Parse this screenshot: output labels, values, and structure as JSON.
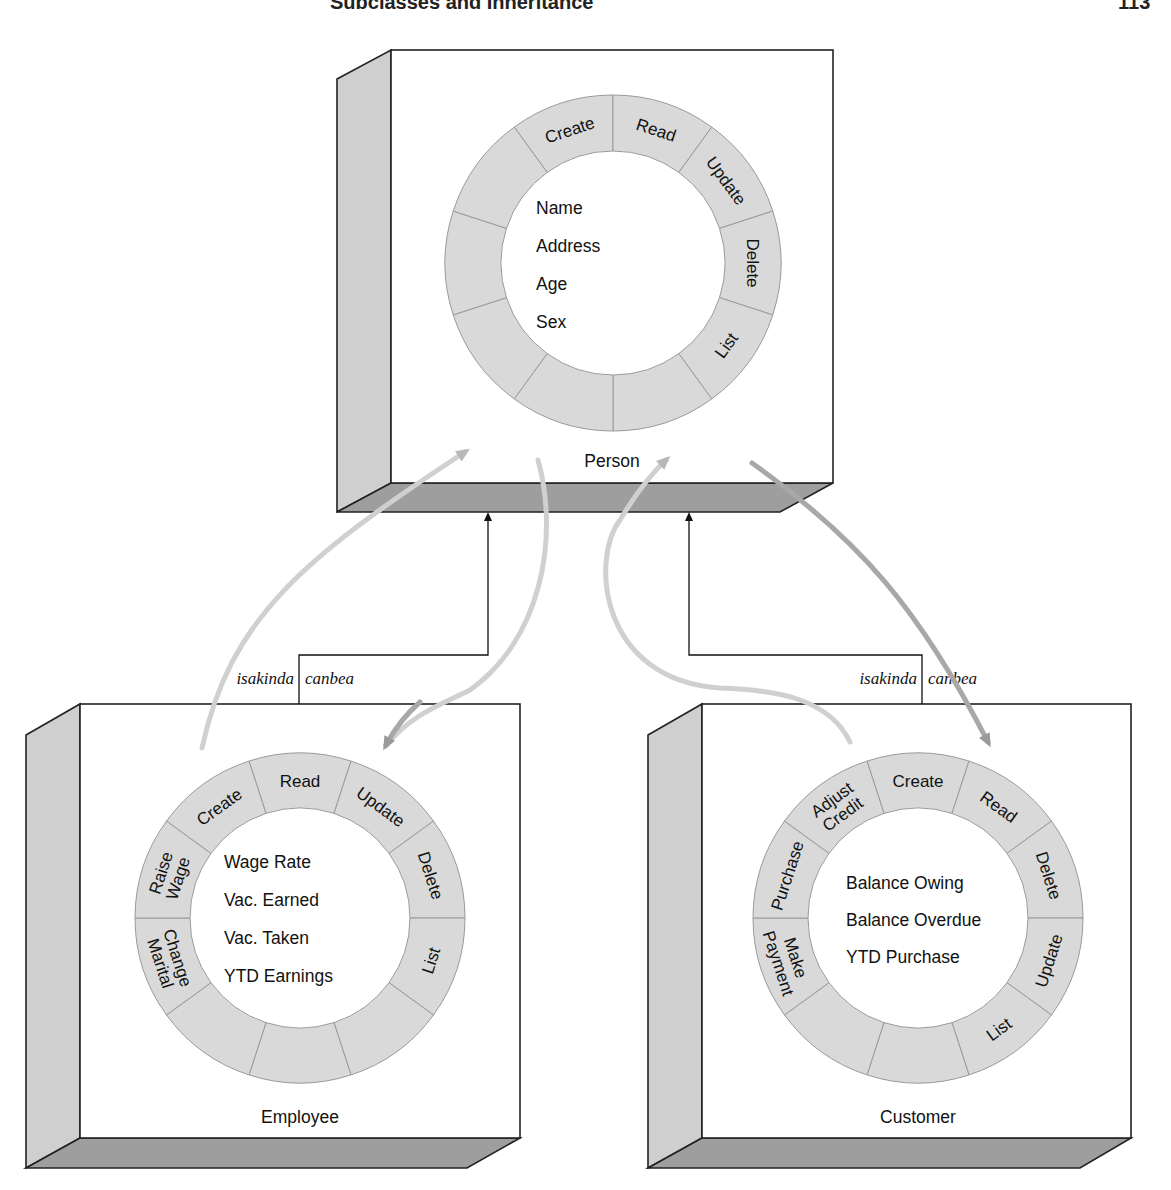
{
  "page_header": {
    "left_fragment": "Subclasses and Inheritance",
    "right_fragment": "113"
  },
  "colors": {
    "ring_fill": "#d9d9d9",
    "ring_stroke": "#9a9a9a",
    "box_side": "#cfcfcf",
    "box_bottom": "#9e9e9e",
    "arrow_light": "#d0d0d0",
    "arrow_dark": "#a8a8a8"
  },
  "classes": {
    "person": {
      "name": "Person",
      "attributes": [
        "Name",
        "Address",
        "Age",
        "Sex"
      ],
      "operations": [
        "Create",
        "Read",
        "Update",
        "Delete",
        "List",
        "",
        "",
        "",
        "",
        ""
      ]
    },
    "employee": {
      "name": "Employee",
      "attributes": [
        "Wage Rate",
        "Vac. Earned",
        "Vac. Taken",
        "YTD Earnings"
      ],
      "operations": [
        "Read",
        "Update",
        "Delete",
        "List",
        "",
        "",
        "",
        "Change Marital",
        "Raise Wage",
        "Create"
      ]
    },
    "customer": {
      "name": "Customer",
      "attributes": [
        "Balance Owing",
        "Balance Overdue",
        "YTD Purchase"
      ],
      "operations": [
        "Create",
        "Read",
        "Delete",
        "Update",
        "List",
        "",
        "",
        "Make Payment",
        "Purchase",
        "Adjust Credit"
      ]
    }
  },
  "relationships": {
    "employee_to_person": {
      "left_label": "isakinda",
      "right_label": "canbea"
    },
    "customer_to_person": {
      "left_label": "isakinda",
      "right_label": "canbea"
    }
  }
}
